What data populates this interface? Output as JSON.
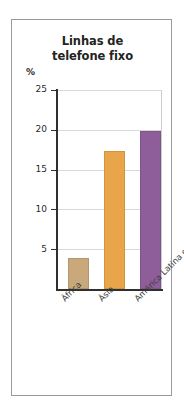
{
  "chart_data": {
    "type": "bar",
    "title": "Linhas de telefone fixo",
    "title_lines": [
      "Linhas de",
      "telefone fixo"
    ],
    "xlabel": "",
    "ylabel": "",
    "unit_label": "%",
    "categories": [
      "África",
      "Ásia",
      "América Latina e Caribe"
    ],
    "values": [
      3.9,
      17.3,
      19.9
    ],
    "ylim": [
      0,
      25
    ],
    "ytick_labels": [
      "25",
      "20",
      "15",
      "10",
      "5"
    ],
    "yticks": [
      25,
      20,
      15,
      10,
      5
    ],
    "grid": true,
    "legend": "none",
    "series": [
      {
        "name": "Linhas de telefone fixo",
        "values": [
          3.9,
          17.3,
          19.9
        ]
      }
    ],
    "bar_colors": [
      "#c9a87b",
      "#e8a549",
      "#8e5e9b"
    ],
    "axis_color": "#2f2f2f",
    "grid_color": "#d8d8d8",
    "frame_color": "#9a9a9a",
    "title_color": "#232323",
    "label_color": "#3a3a3a"
  }
}
